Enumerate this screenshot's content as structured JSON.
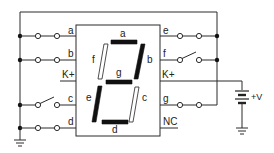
{
  "diagram": {
    "title": "",
    "display": {
      "segment_labels": {
        "a": "a",
        "b": "b",
        "c": "c",
        "d": "d",
        "e": "e",
        "f": "f",
        "g": "g"
      },
      "segments_lit": {
        "a": true,
        "b": true,
        "c": false,
        "d": true,
        "e": true,
        "f": false,
        "g": true
      },
      "colors": {
        "lit": "#111111",
        "unlit": "#ffffff"
      }
    },
    "left_pins": [
      {
        "label": "a",
        "switch": "closed"
      },
      {
        "label": "b",
        "switch": "closed"
      },
      {
        "label": "K+",
        "switch": "none"
      },
      {
        "label": "c",
        "switch": "open"
      },
      {
        "label": "d",
        "switch": "closed"
      }
    ],
    "right_pins": [
      {
        "label": "e",
        "switch": "closed"
      },
      {
        "label": "f",
        "switch": "open"
      },
      {
        "label": "K+",
        "switch": "none"
      },
      {
        "label": "g",
        "switch": "closed"
      },
      {
        "label": "NC",
        "switch": "none"
      }
    ],
    "supply": {
      "label": "+V",
      "icon": "battery-icon"
    },
    "grounds": [
      "ground-icon",
      "ground-icon"
    ]
  }
}
